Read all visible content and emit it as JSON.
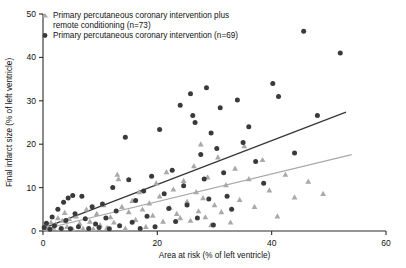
{
  "chart_data": {
    "type": "scatter",
    "title": "",
    "xlabel": "Area at risk (% of left ventricle)",
    "ylabel": "Final infarct size (% of left ventricle)",
    "xlim": [
      0,
      60
    ],
    "ylim": [
      0,
      50
    ],
    "xticks": [
      0,
      20,
      40,
      60
    ],
    "yticks": [
      0,
      10,
      20,
      30,
      40,
      50
    ],
    "grid": false,
    "legend_position": "top-left",
    "series": [
      {
        "name": "Primary percutaneous coronary intervention plus remote conditioning (n=73)",
        "legend_line_1": "Primary percutaneous coronary intervention plus",
        "legend_line_2": "remote conditioning (n=73)",
        "marker": "triangle",
        "color": "#a9a9a9",
        "n": 73,
        "points": [
          [
            0.4,
            0.6
          ],
          [
            0.8,
            1.2
          ],
          [
            1.0,
            0.3
          ],
          [
            1.4,
            2.0
          ],
          [
            1.8,
            0.8
          ],
          [
            2.2,
            1.6
          ],
          [
            2.6,
            3.0
          ],
          [
            3.0,
            0.5
          ],
          [
            3.4,
            2.4
          ],
          [
            3.8,
            4.2
          ],
          [
            4.2,
            1.0
          ],
          [
            4.6,
            2.8
          ],
          [
            5.2,
            0.4
          ],
          [
            5.8,
            3.4
          ],
          [
            6.4,
            1.8
          ],
          [
            7.0,
            0.6
          ],
          [
            7.6,
            5.0
          ],
          [
            8.2,
            2.2
          ],
          [
            8.8,
            0.5
          ],
          [
            9.4,
            4.0
          ],
          [
            10.0,
            1.4
          ],
          [
            10.6,
            6.0
          ],
          [
            11.2,
            0.8
          ],
          [
            11.8,
            3.2
          ],
          [
            12.4,
            2.0
          ],
          [
            13.0,
            13.0
          ],
          [
            13.2,
            12.0
          ],
          [
            13.8,
            5.6
          ],
          [
            14.4,
            0.6
          ],
          [
            15.0,
            4.4
          ],
          [
            15.6,
            7.0
          ],
          [
            16.2,
            2.6
          ],
          [
            16.8,
            9.0
          ],
          [
            17.4,
            5.0
          ],
          [
            18.0,
            1.0
          ],
          [
            18.6,
            6.4
          ],
          [
            19.2,
            3.6
          ],
          [
            19.8,
            11.0
          ],
          [
            20.4,
            8.0
          ],
          [
            21.0,
            2.2
          ],
          [
            21.6,
            13.6
          ],
          [
            22.2,
            5.4
          ],
          [
            22.8,
            9.6
          ],
          [
            23.4,
            4.0
          ],
          [
            24.0,
            3.0
          ],
          [
            24.6,
            11.6
          ],
          [
            25.2,
            6.8
          ],
          [
            25.8,
            2.4
          ],
          [
            26.4,
            15.0
          ],
          [
            26.8,
            9.0
          ],
          [
            27.2,
            4.6
          ],
          [
            27.6,
            20.0
          ],
          [
            28.0,
            7.6
          ],
          [
            28.4,
            3.2
          ],
          [
            28.8,
            12.4
          ],
          [
            29.4,
            1.4
          ],
          [
            30.0,
            6.0
          ],
          [
            30.6,
            17.0
          ],
          [
            31.2,
            4.4
          ],
          [
            32.0,
            10.6
          ],
          [
            32.8,
            2.0
          ],
          [
            33.6,
            14.4
          ],
          [
            34.4,
            7.2
          ],
          [
            35.2,
            19.6
          ],
          [
            36.0,
            12.0
          ],
          [
            37.0,
            5.6
          ],
          [
            38.4,
            16.4
          ],
          [
            39.6,
            9.4
          ],
          [
            41.0,
            3.4
          ],
          [
            42.4,
            13.0
          ],
          [
            44.0,
            7.8
          ],
          [
            46.4,
            11.4
          ],
          [
            49.0,
            8.6
          ]
        ]
      },
      {
        "name": "Primary percutaneous coronary intervention (n=69)",
        "legend_line_1": "Primary percutaneous coronary intervention (n=69)",
        "marker": "circle",
        "color": "#3a3a3a",
        "n": 69,
        "points": [
          [
            0.2,
            0.8
          ],
          [
            0.6,
            1.8
          ],
          [
            1.2,
            0.4
          ],
          [
            1.6,
            3.2
          ],
          [
            2.0,
            1.2
          ],
          [
            2.6,
            5.0
          ],
          [
            3.2,
            0.6
          ],
          [
            3.6,
            6.6
          ],
          [
            4.0,
            2.4
          ],
          [
            4.4,
            7.6
          ],
          [
            4.8,
            0.5
          ],
          [
            5.2,
            8.2
          ],
          [
            5.6,
            4.0
          ],
          [
            6.2,
            1.0
          ],
          [
            6.8,
            8.0
          ],
          [
            7.4,
            2.8
          ],
          [
            8.0,
            0.6
          ],
          [
            8.6,
            5.6
          ],
          [
            9.2,
            1.6
          ],
          [
            9.8,
            0.8
          ],
          [
            10.4,
            6.2
          ],
          [
            11.0,
            3.0
          ],
          [
            11.6,
            0.5
          ],
          [
            12.2,
            10.0
          ],
          [
            12.8,
            4.6
          ],
          [
            13.4,
            1.2
          ],
          [
            14.4,
            21.6
          ],
          [
            15.0,
            11.8
          ],
          [
            15.6,
            2.0
          ],
          [
            16.2,
            7.0
          ],
          [
            17.0,
            0.6
          ],
          [
            17.6,
            9.2
          ],
          [
            18.2,
            3.4
          ],
          [
            19.0,
            12.6
          ],
          [
            19.6,
            1.0
          ],
          [
            20.4,
            23.4
          ],
          [
            21.2,
            8.6
          ],
          [
            22.0,
            5.2
          ],
          [
            22.6,
            14.0
          ],
          [
            23.2,
            2.2
          ],
          [
            24.0,
            29.0
          ],
          [
            24.6,
            10.4
          ],
          [
            25.2,
            6.0
          ],
          [
            25.8,
            31.6
          ],
          [
            26.2,
            26.6
          ],
          [
            26.6,
            25.0
          ],
          [
            27.0,
            3.0
          ],
          [
            27.6,
            17.6
          ],
          [
            28.2,
            12.0
          ],
          [
            28.6,
            33.0
          ],
          [
            29.0,
            7.4
          ],
          [
            29.4,
            22.6
          ],
          [
            29.8,
            1.4
          ],
          [
            30.4,
            19.0
          ],
          [
            31.0,
            28.4
          ],
          [
            31.6,
            13.4
          ],
          [
            32.2,
            8.0
          ],
          [
            33.0,
            5.0
          ],
          [
            34.0,
            30.2
          ],
          [
            35.0,
            20.4
          ],
          [
            36.0,
            24.0
          ],
          [
            37.2,
            16.0
          ],
          [
            38.6,
            11.0
          ],
          [
            40.2,
            34.0
          ],
          [
            41.2,
            31.0
          ],
          [
            44.0,
            18.0
          ],
          [
            45.6,
            46.0
          ],
          [
            48.0,
            26.6
          ],
          [
            52.0,
            41.0
          ]
        ]
      }
    ],
    "fit_lines": [
      {
        "series": "Primary percutaneous coronary intervention (n=69)",
        "color": "#3a3a3a",
        "x1": 0.0,
        "y1": 0.6,
        "x2": 53.0,
        "y2": 27.4
      },
      {
        "series": "Primary percutaneous coronary intervention plus remote conditioning (n=73)",
        "color": "#a7a7a7",
        "x1": 0.0,
        "y1": 0.4,
        "x2": 54.0,
        "y2": 17.6
      }
    ]
  }
}
